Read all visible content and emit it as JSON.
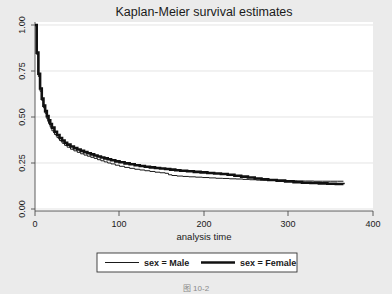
{
  "figure": {
    "caption": "图 10-2",
    "background_color": "#ebebeb",
    "plot_background_color": "#ffffff"
  },
  "chart_data": {
    "type": "line",
    "title": "Kaplan-Meier survival estimates",
    "xlabel": "analysis time",
    "ylabel": "",
    "xlim": [
      0,
      400
    ],
    "ylim": [
      0,
      1
    ],
    "grid": true,
    "legend_position": "bottom",
    "xticks": [
      0,
      100,
      200,
      300,
      400
    ],
    "xtick_labels": [
      "0",
      "100",
      "200",
      "300",
      "400"
    ],
    "yticks": [
      0.0,
      0.25,
      0.5,
      0.75,
      1.0
    ],
    "ytick_labels": [
      "0.00",
      "0.25",
      "0.50",
      "0.75",
      "1.00"
    ],
    "series": [
      {
        "name": "sex = Male",
        "color": "#1a1a1a",
        "line_width": 1.0,
        "style": "step",
        "x": [
          0,
          2,
          4,
          6,
          8,
          10,
          12,
          14,
          16,
          18,
          20,
          23,
          26,
          29,
          32,
          35,
          38,
          42,
          46,
          50,
          54,
          58,
          62,
          66,
          70,
          74,
          78,
          82,
          86,
          90,
          95,
          100,
          106,
          112,
          118,
          124,
          130,
          136,
          142,
          148,
          154,
          158,
          162,
          168,
          175,
          182,
          190,
          198,
          206,
          214,
          222,
          230,
          238,
          246,
          254,
          262,
          270,
          280,
          290,
          300,
          310,
          320,
          330,
          340,
          350,
          358,
          365
        ],
        "y": [
          1.0,
          0.84,
          0.72,
          0.64,
          0.59,
          0.55,
          0.52,
          0.49,
          0.465,
          0.445,
          0.425,
          0.405,
          0.388,
          0.372,
          0.358,
          0.346,
          0.336,
          0.325,
          0.316,
          0.308,
          0.3,
          0.293,
          0.287,
          0.281,
          0.275,
          0.268,
          0.262,
          0.256,
          0.25,
          0.245,
          0.238,
          0.232,
          0.226,
          0.221,
          0.216,
          0.212,
          0.208,
          0.204,
          0.2,
          0.197,
          0.194,
          0.186,
          0.182,
          0.179,
          0.177,
          0.175,
          0.173,
          0.171,
          0.169,
          0.167,
          0.166,
          0.164,
          0.163,
          0.161,
          0.159,
          0.157,
          0.156,
          0.155,
          0.154,
          0.153,
          0.152,
          0.152,
          0.151,
          0.151,
          0.151,
          0.151,
          0.151
        ]
      },
      {
        "name": "sex = Female",
        "color": "#111111",
        "line_width": 2.6,
        "style": "step",
        "x": [
          0,
          2,
          4,
          6,
          8,
          10,
          12,
          14,
          16,
          18,
          20,
          23,
          26,
          29,
          32,
          35,
          38,
          42,
          46,
          50,
          54,
          58,
          62,
          66,
          70,
          74,
          78,
          82,
          86,
          90,
          95,
          100,
          106,
          112,
          118,
          124,
          130,
          136,
          142,
          148,
          154,
          160,
          166,
          172,
          180,
          188,
          196,
          204,
          212,
          220,
          228,
          236,
          244,
          252,
          260,
          268,
          276,
          286,
          296,
          306,
          316,
          326,
          336,
          346,
          356,
          365
        ],
        "y": [
          1.0,
          0.85,
          0.735,
          0.655,
          0.6,
          0.562,
          0.532,
          0.505,
          0.482,
          0.462,
          0.442,
          0.42,
          0.402,
          0.386,
          0.372,
          0.36,
          0.35,
          0.34,
          0.331,
          0.323,
          0.316,
          0.309,
          0.303,
          0.297,
          0.291,
          0.285,
          0.28,
          0.275,
          0.27,
          0.265,
          0.259,
          0.254,
          0.248,
          0.243,
          0.238,
          0.234,
          0.23,
          0.226,
          0.223,
          0.22,
          0.217,
          0.214,
          0.211,
          0.208,
          0.205,
          0.202,
          0.199,
          0.196,
          0.193,
          0.19,
          0.186,
          0.181,
          0.176,
          0.171,
          0.166,
          0.162,
          0.158,
          0.154,
          0.15,
          0.146,
          0.143,
          0.141,
          0.139,
          0.137,
          0.136,
          0.135
        ]
      }
    ]
  }
}
